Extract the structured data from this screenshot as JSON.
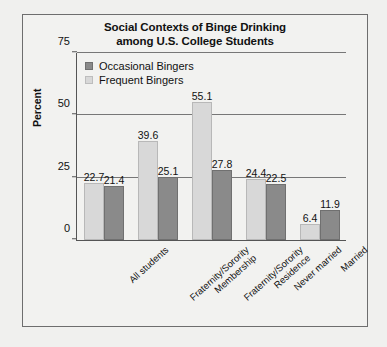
{
  "chart_data": {
    "type": "bar",
    "title": "Social Contexts of Binge Drinking among U.S. College Students",
    "title_lines": [
      "Social Contexts of Binge Drinking",
      "among U.S. College Students"
    ],
    "xlabel": "",
    "ylabel": "Percent",
    "ylim": [
      0,
      75
    ],
    "yticks": [
      0,
      25,
      50,
      75
    ],
    "ytick_labels": [
      "0",
      "25",
      "50",
      "75"
    ],
    "grid": true,
    "grid_axis": "y",
    "legend_position": "upper-left-inside",
    "categories": [
      "All students",
      "Fraternity/Sorority Membership",
      "Fraternity/Sorority Residence",
      "Never married",
      "Married"
    ],
    "category_lines": [
      [
        "All students"
      ],
      [
        "Fraternity/Sorority",
        "Membership"
      ],
      [
        "Fraternity/Sorority",
        "Residence"
      ],
      [
        "Never married"
      ],
      [
        "Married"
      ]
    ],
    "series": [
      {
        "name": "Frequent Bingers",
        "color": "#d8d8d8",
        "values": [
          22.7,
          39.6,
          55.1,
          24.4,
          6.4
        ],
        "value_labels": [
          "22.7",
          "39.6",
          "55.1",
          "24.4",
          "6.4"
        ]
      },
      {
        "name": "Occasional Bingers",
        "color": "#8a8a8a",
        "values": [
          21.4,
          25.1,
          27.8,
          22.5,
          11.9
        ],
        "value_labels": [
          "21.4",
          "25.1",
          "27.8",
          "22.5",
          "11.9"
        ]
      }
    ]
  },
  "legend": {
    "items": [
      {
        "label": "Occasional Bingers",
        "swatch": "occasional"
      },
      {
        "label": "Frequent Bingers",
        "swatch": "frequent"
      }
    ]
  },
  "colors": {
    "occasional": "#8a8a8a",
    "frequent": "#d8d8d8",
    "frame": "#6e6e6e",
    "axis": "#555555",
    "grid": "#777777",
    "background": "#f2f2f0"
  }
}
